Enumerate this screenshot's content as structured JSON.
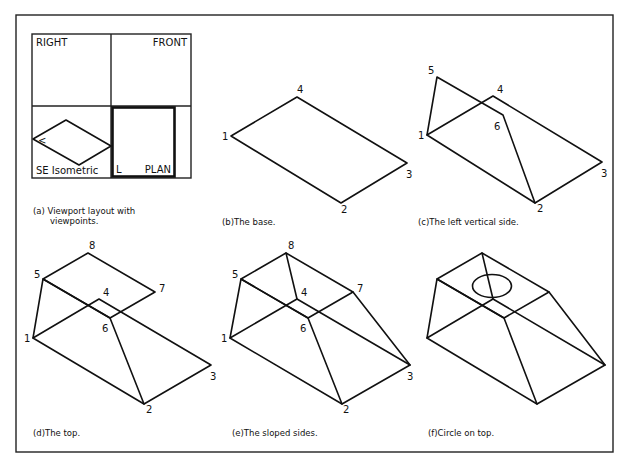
{
  "figure": {
    "panels": [
      {
        "id": "a",
        "caption_line1": "(a) Viewport layout with",
        "caption_line2": "viewpoints."
      },
      {
        "id": "b",
        "caption": "(b)The  base."
      },
      {
        "id": "c",
        "caption": "(c)The  left  vertical  side."
      },
      {
        "id": "d",
        "caption": "(d)The  top."
      },
      {
        "id": "e",
        "caption": "(e)The  sloped  sides."
      },
      {
        "id": "f",
        "caption": "(f)Circle  on  top."
      }
    ],
    "viewports": {
      "right": "RIGHT",
      "front": "FRONT",
      "se_isometric": "SE  Isometric",
      "plan": "PLAN",
      "ucs_glyph_iso": "<",
      "ucs_glyph_plan": "L"
    },
    "vertex_labels": {
      "v1": "1",
      "v2": "2",
      "v3": "3",
      "v4": "4",
      "v5": "5",
      "v6": "6",
      "v7": "7",
      "v8": "8"
    },
    "colors": {
      "line": "#111111",
      "background": "#ffffff"
    }
  }
}
